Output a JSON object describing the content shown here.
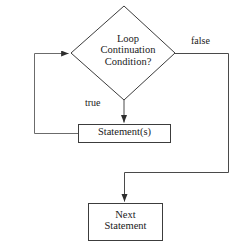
{
  "diagram": {
    "type": "flowchart",
    "stroke_color": "#3c3c3c",
    "text_color": "#1a1a1a",
    "background_color": "#ffffff",
    "nodes": {
      "decision": {
        "shape": "diamond",
        "lines": [
          "Loop",
          "Continuation",
          "Condition?"
        ],
        "text": "Loop Continuation Condition?"
      },
      "statement": {
        "shape": "rectangle",
        "lines": [
          "Statement(s)"
        ],
        "text": "Statement(s)"
      },
      "next_statement": {
        "shape": "rectangle",
        "lines": [
          "Next",
          "Statement"
        ],
        "text": "Next Statement"
      }
    },
    "edges": {
      "true_branch": {
        "label": "true",
        "from": "decision",
        "to": "statement"
      },
      "false_branch": {
        "label": "false",
        "from": "decision",
        "to": "next_statement"
      },
      "loop_back": {
        "label": "",
        "from": "statement",
        "to": "decision"
      }
    }
  }
}
